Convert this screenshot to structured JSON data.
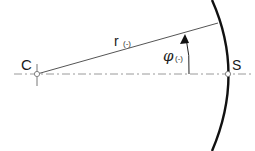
{
  "diagram": {
    "labels": {
      "center": "C",
      "radius_symbol": "r",
      "radius_unit": "(-)",
      "angle_symbol": "φ",
      "angle_unit": "(-)",
      "surface_point": "S"
    },
    "colors": {
      "lines": "#555555",
      "arc": "#111111",
      "axis": "#999999",
      "text": "#1a1a1a"
    }
  }
}
